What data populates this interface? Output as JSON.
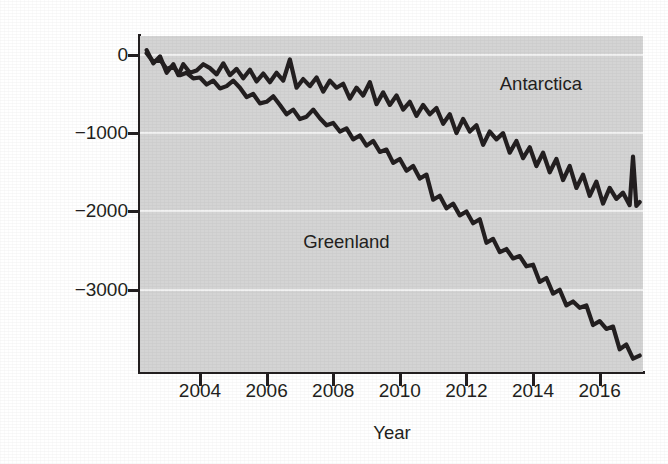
{
  "chart_data": {
    "type": "line",
    "title": "",
    "xlabel": "Year",
    "ylabel": "Ice lost to melting (billion metric tons)",
    "xlim": [
      2002.2,
      2017.3
    ],
    "ylim": [
      -4050,
      240
    ],
    "xticks": [
      2004,
      2006,
      2008,
      2010,
      2012,
      2014,
      2016
    ],
    "xticklabels": [
      "2004",
      "2006",
      "2008",
      "2010",
      "2012",
      "2014",
      "2016"
    ],
    "yticks": [
      0,
      -1000,
      -2000,
      -3000
    ],
    "yticklabels": [
      "0",
      "−1000",
      "−2000",
      "−3000"
    ],
    "grid": "horizontal-white-on-gray",
    "legend": "inline-annotations",
    "plot_background": "#d4d4d4",
    "gridline_color": "#f2f2f2",
    "line_color": "#231f20",
    "series": [
      {
        "name": "Antarctica",
        "annotation": "Antarctica",
        "annotation_x": 2013.0,
        "annotation_y": -380,
        "x": [
          2002.4,
          2002.6,
          2002.8,
          2003.0,
          2003.2,
          2003.35,
          2003.5,
          2003.7,
          2003.9,
          2004.1,
          2004.3,
          2004.5,
          2004.7,
          2004.9,
          2005.1,
          2005.3,
          2005.5,
          2005.7,
          2005.9,
          2006.1,
          2006.3,
          2006.5,
          2006.7,
          2006.9,
          2007.1,
          2007.3,
          2007.5,
          2007.7,
          2007.9,
          2008.1,
          2008.3,
          2008.5,
          2008.7,
          2008.9,
          2009.1,
          2009.3,
          2009.5,
          2009.7,
          2009.9,
          2010.1,
          2010.3,
          2010.5,
          2010.7,
          2010.9,
          2011.1,
          2011.3,
          2011.5,
          2011.7,
          2011.9,
          2012.1,
          2012.3,
          2012.5,
          2012.7,
          2012.9,
          2013.1,
          2013.3,
          2013.5,
          2013.7,
          2013.9,
          2014.1,
          2014.3,
          2014.5,
          2014.7,
          2014.9,
          2015.1,
          2015.3,
          2015.5,
          2015.7,
          2015.9,
          2016.1,
          2016.3,
          2016.5,
          2016.7,
          2016.9,
          2017.0,
          2017.1,
          2017.2
        ],
        "y": [
          60,
          -110,
          -20,
          -230,
          -120,
          -260,
          -120,
          -230,
          -200,
          -120,
          -170,
          -250,
          -110,
          -260,
          -180,
          -300,
          -190,
          -340,
          -240,
          -350,
          -230,
          -330,
          -60,
          -420,
          -310,
          -400,
          -290,
          -470,
          -330,
          -420,
          -370,
          -560,
          -420,
          -520,
          -350,
          -630,
          -480,
          -640,
          -520,
          -700,
          -600,
          -780,
          -640,
          -760,
          -680,
          -880,
          -760,
          -1000,
          -820,
          -980,
          -900,
          -1150,
          -980,
          -1080,
          -1000,
          -1250,
          -1100,
          -1320,
          -1180,
          -1420,
          -1250,
          -1500,
          -1330,
          -1600,
          -1420,
          -1700,
          -1530,
          -1800,
          -1620,
          -1900,
          -1700,
          -1840,
          -1760,
          -1920,
          -1300,
          -1930,
          -1880
        ]
      },
      {
        "name": "Greenland",
        "annotation": "Greenland",
        "annotation_x": 2007.1,
        "annotation_y": -2400,
        "x": [
          2002.4,
          2002.6,
          2002.8,
          2003.0,
          2003.2,
          2003.4,
          2003.6,
          2003.8,
          2004.0,
          2004.2,
          2004.4,
          2004.6,
          2004.8,
          2005.0,
          2005.2,
          2005.4,
          2005.6,
          2005.8,
          2006.0,
          2006.2,
          2006.4,
          2006.6,
          2006.8,
          2007.0,
          2007.2,
          2007.4,
          2007.6,
          2007.8,
          2008.0,
          2008.2,
          2008.4,
          2008.6,
          2008.8,
          2009.0,
          2009.2,
          2009.4,
          2009.6,
          2009.8,
          2010.0,
          2010.2,
          2010.4,
          2010.6,
          2010.8,
          2011.0,
          2011.2,
          2011.4,
          2011.6,
          2011.8,
          2012.0,
          2012.2,
          2012.4,
          2012.6,
          2012.8,
          2013.0,
          2013.2,
          2013.4,
          2013.6,
          2013.8,
          2014.0,
          2014.2,
          2014.4,
          2014.6,
          2014.8,
          2015.0,
          2015.2,
          2015.4,
          2015.6,
          2015.8,
          2016.0,
          2016.2,
          2016.4,
          2016.6,
          2016.8,
          2017.0,
          2017.2
        ],
        "y": [
          20,
          -90,
          -60,
          -180,
          -150,
          -260,
          -230,
          -300,
          -290,
          -380,
          -330,
          -430,
          -400,
          -330,
          -420,
          -540,
          -500,
          -620,
          -600,
          -530,
          -640,
          -760,
          -700,
          -820,
          -790,
          -700,
          -810,
          -900,
          -870,
          -980,
          -940,
          -1080,
          -1030,
          -1160,
          -1100,
          -1240,
          -1210,
          -1380,
          -1330,
          -1480,
          -1420,
          -1580,
          -1530,
          -1850,
          -1800,
          -1960,
          -1900,
          -2050,
          -2000,
          -2150,
          -2100,
          -2400,
          -2350,
          -2520,
          -2480,
          -2600,
          -2570,
          -2700,
          -2680,
          -2900,
          -2850,
          -3050,
          -3000,
          -3200,
          -3150,
          -3230,
          -3200,
          -3450,
          -3400,
          -3500,
          -3470,
          -3760,
          -3700,
          -3880,
          -3840
        ]
      }
    ]
  }
}
